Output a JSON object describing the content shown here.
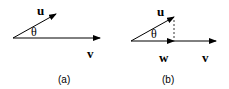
{
  "panels": [
    {
      "caption": "(a)",
      "vectors": [
        {
          "name": "u",
          "label": "u"
        },
        {
          "name": "v",
          "label": "v"
        }
      ],
      "angle_label": "θ"
    },
    {
      "caption": "(b)",
      "vectors": [
        {
          "name": "u",
          "label": "u"
        },
        {
          "name": "w",
          "label": "w"
        },
        {
          "name": "v",
          "label": "v"
        }
      ],
      "angle_label": "θ",
      "projection": "dashed perpendicular from tip of u to v"
    }
  ],
  "colors": {
    "stroke": "#000000",
    "background": "#ffffff"
  }
}
